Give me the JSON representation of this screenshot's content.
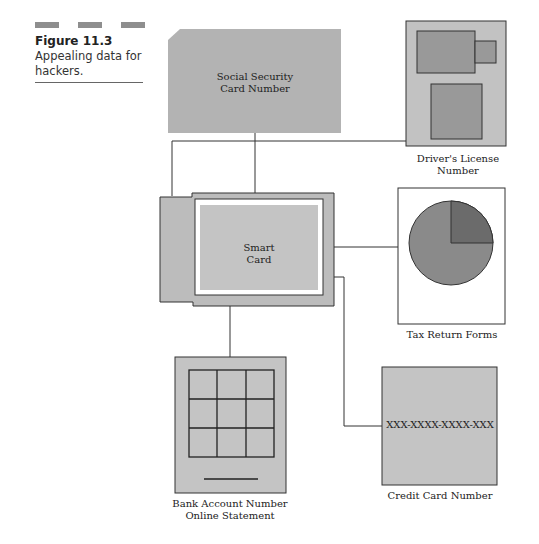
{
  "caption": {
    "figure_number": "Figure 11.3",
    "text_line1": "Appealing data for",
    "text_line2": "hackers."
  },
  "nodes": {
    "social_security": {
      "line1": "Social Security",
      "line2": "Card Number"
    },
    "drivers_license": {
      "line1": "Driver's  License",
      "line2": "Number"
    },
    "smart_card": {
      "line1": "Smart",
      "line2": "Card"
    },
    "tax_return": {
      "label": "Tax Return Forms"
    },
    "bank_account": {
      "line1": "Bank Account Number",
      "line2": "Online Statement"
    },
    "credit_card": {
      "number": "XXX-XXXX-XXXX-XXX",
      "label": "Credit Card Number"
    }
  },
  "colors": {
    "card_fill": "#bdbdbd",
    "dark_fill": "#8f8f8f",
    "pie_main": "#8a8a8a",
    "pie_slice": "#6a6a6a",
    "stroke": "#333333"
  }
}
